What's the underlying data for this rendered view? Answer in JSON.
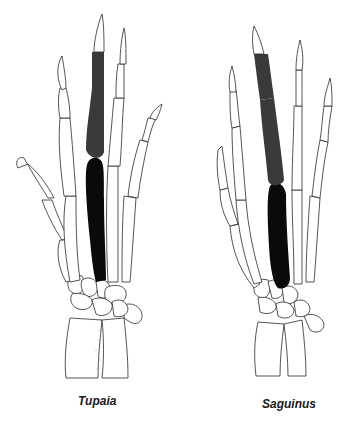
{
  "figure": {
    "panels": [
      {
        "label": "Tupaia",
        "highlighted_finger": "digit III",
        "phalanges_color": "#3a3a3a",
        "metacarpal_color": "#0a0a0a"
      },
      {
        "label": "Saguinus",
        "highlighted_finger": "digit III",
        "phalanges_color": "#3a3a3a",
        "metacarpal_color": "#0a0a0a"
      }
    ],
    "colors": {
      "background": "#ffffff",
      "outline": "#2a2a2a",
      "phalanges": "#3a3a3a",
      "metacarpal": "#0a0a0a"
    }
  }
}
